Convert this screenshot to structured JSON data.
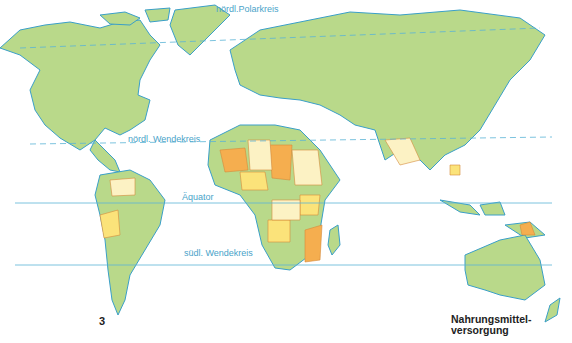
{
  "map": {
    "number": "3",
    "title_line1": "Nahrungsmittel-",
    "title_line2": "versorgung",
    "lines": {
      "arctic_circle": "nördl.Polarkreis",
      "tropic_cancer": "nördl. Wendekreis",
      "equator": "Äquator",
      "tropic_capricorn": "südl. Wendekreis"
    },
    "colors": {
      "water_line": "#5ab4d6",
      "sufficient": "#b9d98a",
      "slightly_insufficient": "#fcf2c4",
      "insufficient": "#fbe37a",
      "very_insufficient": "#f5ae4f",
      "border": "#d58a3a",
      "coast": "#3a9fc8"
    }
  }
}
